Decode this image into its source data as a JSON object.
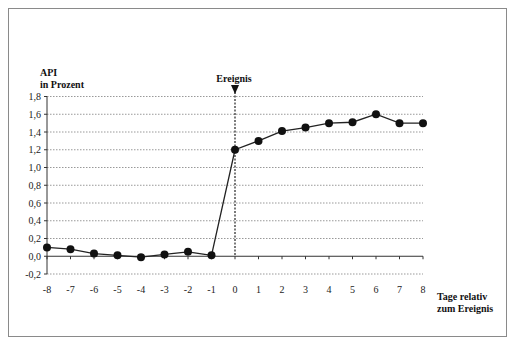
{
  "chart_data": {
    "type": "line",
    "title": "",
    "ylabel_line1": "API",
    "ylabel_line2": "in Prozent",
    "xlabel_line1": "Tage relativ",
    "xlabel_line2": "zum Ereignis",
    "annotation": "Ereignis",
    "x": [
      -8,
      -7,
      -6,
      -5,
      -4,
      -3,
      -2,
      -1,
      0,
      1,
      2,
      3,
      4,
      5,
      6,
      7,
      8
    ],
    "values": [
      0.1,
      0.08,
      0.03,
      0.01,
      -0.01,
      0.02,
      0.05,
      0.01,
      1.2,
      1.3,
      1.41,
      1.45,
      1.5,
      1.51,
      1.6,
      1.5,
      1.5
    ],
    "ylim": [
      -0.2,
      1.8
    ],
    "xlim": [
      -8,
      8
    ],
    "yticks": [
      "-0,2",
      "0,0",
      "0,2",
      "0,4",
      "0,6",
      "0,8",
      "1,0",
      "1,2",
      "1,4",
      "1,6",
      "1,8"
    ],
    "xticks": [
      "-8",
      "-7",
      "-6",
      "-5",
      "-4",
      "-3",
      "-2",
      "-1",
      "0",
      "1",
      "2",
      "3",
      "4",
      "5",
      "6",
      "7",
      "8"
    ],
    "grid": true,
    "legend": "none",
    "line_color": "#222222",
    "marker_color": "#111111"
  }
}
